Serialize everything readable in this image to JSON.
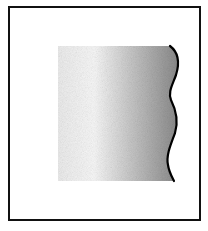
{
  "figure": {
    "type": "patent-style drawing",
    "frame": {
      "x": 8,
      "y": 6,
      "width": 193,
      "height": 215,
      "stroke": "#111111"
    },
    "shaded_panel": {
      "x": 58,
      "y": 46,
      "width": 118,
      "height": 135,
      "gradient": {
        "left": "#f4f4f4",
        "center": "#f7f7f7",
        "right": "#8a8a8a"
      },
      "right_edge": "wavy"
    },
    "wave_edge_color": "#000000"
  }
}
